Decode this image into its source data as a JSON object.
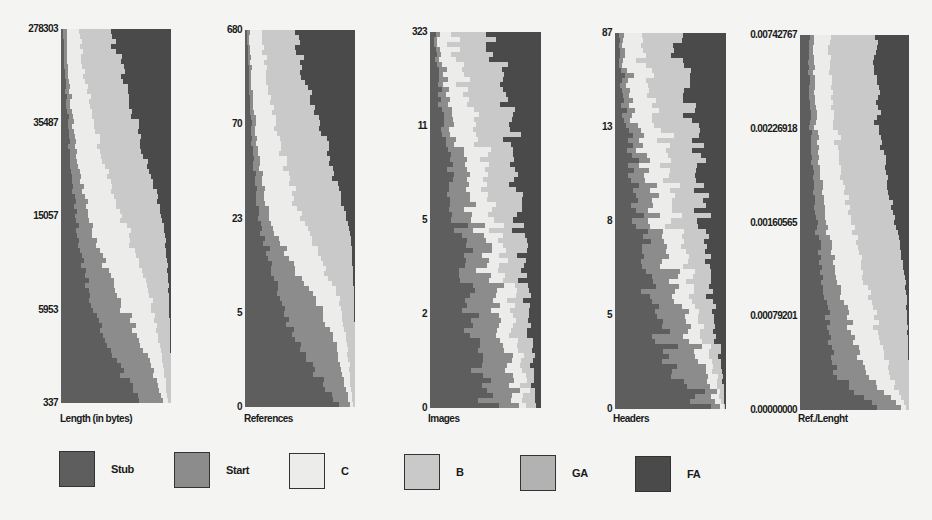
{
  "colors": {
    "Stub": "#5e5e5e",
    "Start": "#8c8c8c",
    "C": "#ececea",
    "B": "#c9c9c9",
    "GA": "#b2b2b2",
    "FA": "#4a4a4a"
  },
  "legend": [
    {
      "label": "Stub",
      "key": "Stub"
    },
    {
      "label": "Start",
      "key": "Start"
    },
    {
      "label": "C",
      "key": "C"
    },
    {
      "label": "B",
      "key": "B"
    },
    {
      "label": "GA",
      "key": "GA"
    },
    {
      "label": "FA",
      "key": "FA"
    }
  ],
  "chart_data": {
    "type": "bar",
    "subtype": "stacked-horizontal-proportion",
    "series_order": [
      "Stub",
      "Start",
      "C",
      "B",
      "GA",
      "FA"
    ],
    "panels": [
      {
        "xlabel": "Length (in bytes)",
        "yticks": [
          "278303",
          "35487",
          "15057",
          "5953",
          "337"
        ],
        "note": "Rows ordered by feature value bins (top = highest). Values = share of each quality class per bin, approx.",
        "profile": [
          [
            0.02,
            0.03,
            0.12,
            0.3,
            0.0,
            0.53
          ],
          [
            0.03,
            0.03,
            0.14,
            0.34,
            0.0,
            0.46
          ],
          [
            0.05,
            0.04,
            0.17,
            0.37,
            0.0,
            0.37
          ],
          [
            0.07,
            0.05,
            0.2,
            0.38,
            0.0,
            0.3
          ],
          [
            0.09,
            0.07,
            0.24,
            0.39,
            0.0,
            0.21
          ],
          [
            0.12,
            0.1,
            0.28,
            0.38,
            0.0,
            0.12
          ],
          [
            0.15,
            0.14,
            0.32,
            0.33,
            0.0,
            0.06
          ],
          [
            0.2,
            0.2,
            0.32,
            0.25,
            0.0,
            0.03
          ],
          [
            0.27,
            0.27,
            0.28,
            0.16,
            0.0,
            0.02
          ],
          [
            0.38,
            0.3,
            0.2,
            0.11,
            0.0,
            0.01
          ],
          [
            0.52,
            0.3,
            0.11,
            0.07,
            0.0,
            0.0
          ],
          [
            0.75,
            0.18,
            0.04,
            0.03,
            0.0,
            0.0
          ]
        ]
      },
      {
        "xlabel": "References",
        "yticks": [
          "680",
          "70",
          "23",
          "5",
          "0"
        ],
        "profile": [
          [
            0.02,
            0.02,
            0.1,
            0.29,
            0.0,
            0.57
          ],
          [
            0.03,
            0.02,
            0.14,
            0.33,
            0.0,
            0.48
          ],
          [
            0.04,
            0.03,
            0.16,
            0.37,
            0.0,
            0.4
          ],
          [
            0.06,
            0.04,
            0.2,
            0.4,
            0.0,
            0.3
          ],
          [
            0.08,
            0.06,
            0.23,
            0.42,
            0.0,
            0.21
          ],
          [
            0.11,
            0.08,
            0.27,
            0.42,
            0.0,
            0.12
          ],
          [
            0.16,
            0.12,
            0.3,
            0.38,
            0.0,
            0.04
          ],
          [
            0.24,
            0.22,
            0.28,
            0.24,
            0.0,
            0.02
          ],
          [
            0.34,
            0.32,
            0.2,
            0.13,
            0.0,
            0.01
          ],
          [
            0.46,
            0.34,
            0.12,
            0.08,
            0.0,
            0.0
          ],
          [
            0.62,
            0.26,
            0.07,
            0.05,
            0.0,
            0.0
          ],
          [
            0.85,
            0.1,
            0.03,
            0.02,
            0.0,
            0.0
          ]
        ]
      },
      {
        "xlabel": "Images",
        "yticks": [
          "323",
          "11",
          "5",
          "2",
          "0"
        ],
        "profile": [
          [
            0.04,
            0.03,
            0.14,
            0.33,
            0.0,
            0.46
          ],
          [
            0.06,
            0.05,
            0.16,
            0.35,
            0.0,
            0.38
          ],
          [
            0.1,
            0.08,
            0.18,
            0.33,
            0.0,
            0.31
          ],
          [
            0.14,
            0.1,
            0.19,
            0.3,
            0.0,
            0.27
          ],
          [
            0.18,
            0.14,
            0.18,
            0.27,
            0.0,
            0.23
          ],
          [
            0.22,
            0.17,
            0.17,
            0.24,
            0.0,
            0.2
          ],
          [
            0.26,
            0.2,
            0.16,
            0.21,
            0.0,
            0.17
          ],
          [
            0.3,
            0.22,
            0.15,
            0.18,
            0.0,
            0.15
          ],
          [
            0.34,
            0.24,
            0.14,
            0.16,
            0.0,
            0.12
          ],
          [
            0.4,
            0.25,
            0.13,
            0.13,
            0.0,
            0.09
          ],
          [
            0.46,
            0.26,
            0.11,
            0.1,
            0.0,
            0.07
          ],
          [
            0.55,
            0.25,
            0.08,
            0.08,
            0.0,
            0.04
          ]
        ]
      },
      {
        "xlabel": "Headers",
        "yticks": [
          "87",
          "13",
          "8",
          "5",
          "0"
        ],
        "profile": [
          [
            0.03,
            0.03,
            0.14,
            0.32,
            0.0,
            0.48
          ],
          [
            0.05,
            0.05,
            0.16,
            0.34,
            0.0,
            0.4
          ],
          [
            0.08,
            0.07,
            0.18,
            0.34,
            0.0,
            0.33
          ],
          [
            0.12,
            0.09,
            0.19,
            0.32,
            0.0,
            0.28
          ],
          [
            0.16,
            0.12,
            0.19,
            0.29,
            0.0,
            0.24
          ],
          [
            0.2,
            0.15,
            0.18,
            0.26,
            0.0,
            0.21
          ],
          [
            0.25,
            0.18,
            0.17,
            0.22,
            0.0,
            0.18
          ],
          [
            0.3,
            0.22,
            0.15,
            0.18,
            0.0,
            0.15
          ],
          [
            0.36,
            0.24,
            0.13,
            0.15,
            0.0,
            0.12
          ],
          [
            0.44,
            0.26,
            0.11,
            0.11,
            0.0,
            0.08
          ],
          [
            0.6,
            0.24,
            0.07,
            0.06,
            0.0,
            0.03
          ],
          [
            0.8,
            0.14,
            0.03,
            0.02,
            0.0,
            0.01
          ]
        ]
      },
      {
        "xlabel": "Ref./Lenght",
        "yticks": [
          "0.00742767",
          "0.00226918",
          "0.00160565",
          "0.00079201",
          "0.00000000"
        ],
        "profile": [
          [
            0.08,
            0.04,
            0.14,
            0.42,
            0.0,
            0.32
          ],
          [
            0.08,
            0.05,
            0.15,
            0.42,
            0.0,
            0.3
          ],
          [
            0.09,
            0.05,
            0.16,
            0.41,
            0.0,
            0.29
          ],
          [
            0.1,
            0.06,
            0.18,
            0.4,
            0.0,
            0.26
          ],
          [
            0.12,
            0.07,
            0.2,
            0.4,
            0.0,
            0.21
          ],
          [
            0.14,
            0.08,
            0.22,
            0.4,
            0.0,
            0.16
          ],
          [
            0.17,
            0.1,
            0.24,
            0.4,
            0.0,
            0.09
          ],
          [
            0.2,
            0.13,
            0.25,
            0.38,
            0.0,
            0.04
          ],
          [
            0.24,
            0.17,
            0.25,
            0.32,
            0.0,
            0.02
          ],
          [
            0.28,
            0.22,
            0.24,
            0.25,
            0.0,
            0.01
          ],
          [
            0.32,
            0.28,
            0.22,
            0.18,
            0.0,
            0.0
          ],
          [
            0.7,
            0.22,
            0.05,
            0.03,
            0.0,
            0.0
          ]
        ]
      }
    ]
  }
}
